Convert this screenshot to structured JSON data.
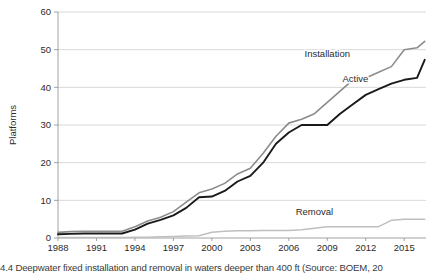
{
  "figure": {
    "caption": "4.4  Deepwater fixed installation and removal in waters deeper than 400 ft (Source: BOEM, 20"
  },
  "chart_data": {
    "type": "line",
    "title": "",
    "xlabel": "",
    "ylabel": "Platforms",
    "xlim": [
      1988,
      2016
    ],
    "ylim": [
      0,
      60
    ],
    "grid": true,
    "legend_position": "inline-right",
    "x_tick_labels": [
      "1988",
      "1991",
      "1994",
      "1997",
      "2000",
      "2003",
      "2006",
      "2009",
      "2012",
      "2015"
    ],
    "x_ticks": [
      1988,
      1991,
      1994,
      1997,
      2000,
      2003,
      2006,
      2009,
      2012,
      2015
    ],
    "y_tick_labels": [
      "0",
      "10",
      "20",
      "30",
      "40",
      "50",
      "60"
    ],
    "y_ticks": [
      0,
      10,
      20,
      30,
      40,
      50,
      60
    ],
    "x": [
      1988,
      1989,
      1990,
      1991,
      1992,
      1993,
      1994,
      1995,
      1996,
      1997,
      1998,
      1999,
      2000,
      2001,
      2002,
      2003,
      2004,
      2005,
      2006,
      2007,
      2008,
      2009,
      2010,
      2011,
      2012,
      2013,
      2014,
      2015,
      2016
    ],
    "series": [
      {
        "name": "Installation",
        "color": "#8c8c8c",
        "width": 1.6,
        "label": "Installation",
        "label_x": 2009.0,
        "label_y": 48.0,
        "values": [
          1.5,
          1.7,
          1.8,
          1.8,
          1.8,
          1.8,
          3.0,
          4.5,
          5.5,
          7.0,
          9.5,
          12.0,
          13.0,
          14.5,
          17.0,
          18.5,
          22.5,
          27.0,
          30.5,
          31.5,
          33.0,
          36.0,
          39.0,
          42.0,
          42.5,
          44.0,
          45.5,
          50.0,
          50.5
        ]
      },
      {
        "name": "Active",
        "color": "#1a1a1a",
        "width": 1.9,
        "label": "Active",
        "label_x": 2011.2,
        "label_y": 41.5,
        "values": [
          1.0,
          1.1,
          1.2,
          1.2,
          1.2,
          1.2,
          2.2,
          3.8,
          4.8,
          6.0,
          8.0,
          10.8,
          11.0,
          12.5,
          15.0,
          16.5,
          20.0,
          25.0,
          28.0,
          30.0,
          30.0,
          30.0,
          33.0,
          35.5,
          38.0,
          39.5,
          41.0,
          42.0,
          42.5
        ]
      },
      {
        "name": "Removal",
        "color": "#bfbfbf",
        "width": 1.5,
        "label": "Removal",
        "label_x": 2008.0,
        "label_y": 6.0,
        "values": [
          0.1,
          0.1,
          0.1,
          0.1,
          0.1,
          0.1,
          0.2,
          0.2,
          0.3,
          0.4,
          0.5,
          0.6,
          1.5,
          1.8,
          1.9,
          1.9,
          2.0,
          2.0,
          2.0,
          2.2,
          2.6,
          3.0,
          3.0,
          3.0,
          3.0,
          3.0,
          4.7,
          5.0,
          5.0
        ]
      }
    ],
    "series_extra": [
      {
        "name": "Installation",
        "x_tail": [
          2016.0,
          2016.6
        ],
        "values_tail": [
          50.5,
          52.2
        ]
      },
      {
        "name": "Active",
        "x_tail": [
          2016.0,
          2016.6
        ],
        "values_tail": [
          42.5,
          47.3
        ]
      },
      {
        "name": "Removal",
        "x_tail": [
          2016.0,
          2016.6
        ],
        "values_tail": [
          5.0,
          5.0
        ]
      }
    ]
  }
}
